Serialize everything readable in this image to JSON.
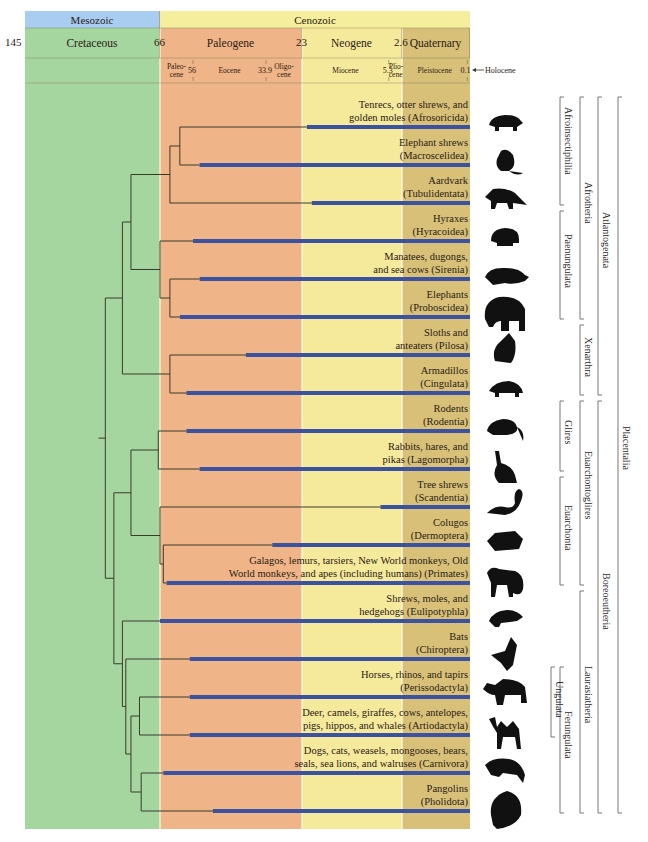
{
  "timescale": {
    "eras": [
      {
        "name": "Mesozoic",
        "color": "#a8cdf0"
      },
      {
        "name": "Cenozoic",
        "color": "#f5ee9c"
      }
    ],
    "periods": [
      {
        "name": "Cretaceous",
        "start_ma": 145,
        "end_ma": 66,
        "color": "#a6d6a0"
      },
      {
        "name": "Paleogene",
        "start_ma": 66,
        "end_ma": 23,
        "color": "#efb487"
      },
      {
        "name": "Neogene",
        "start_ma": 23,
        "end_ma": 2.6,
        "color": "#f5ea9c"
      },
      {
        "name": "Quaternary",
        "start_ma": 2.6,
        "end_ma": 0,
        "color": "#d8c078"
      }
    ],
    "period_boundaries": [
      "145",
      "66",
      "23",
      "2.6"
    ],
    "epochs": [
      {
        "name": "Paleo-\ncene",
        "start_ma": 66,
        "end_ma": 56
      },
      {
        "name": "Eocene",
        "start_ma": 56,
        "end_ma": 33.9
      },
      {
        "name": "Oligo-\ncene",
        "start_ma": 33.9,
        "end_ma": 23
      },
      {
        "name": "Miocene",
        "start_ma": 23,
        "end_ma": 5.3
      },
      {
        "name": "Plio-\ncene",
        "start_ma": 5.3,
        "end_ma": 2.6
      },
      {
        "name": "Pleistocene",
        "start_ma": 2.6,
        "end_ma": 0.1
      }
    ],
    "epoch_boundaries": [
      "56",
      "33.9",
      "5.3",
      "0.1"
    ],
    "holocene_label": "Holocene",
    "unit": "Ma"
  },
  "chart_data": {
    "type": "phylogeny",
    "title": "",
    "x_axis": {
      "label": "Millions of years ago",
      "range": [
        145,
        0
      ]
    },
    "leaves": [
      {
        "id": "afrosoricida",
        "label": "Tenrecs, otter shrews, and\ngolden moles (Afrosoricida)",
        "crown_age_ma": 22
      },
      {
        "id": "macroscelidea",
        "label": "Elephant shrews\n(Macroscelidea)",
        "crown_age_ma": 54
      },
      {
        "id": "tubulidentata",
        "label": "Aardvark\n(Tubulidentata)",
        "crown_age_ma": 21
      },
      {
        "id": "hyracoidea",
        "label": "Hyraxes\n(Hyracoidea)",
        "crown_age_ma": 56
      },
      {
        "id": "sirenia",
        "label": "Manatees, dugongs,\nand sea cows (Sirenia)",
        "crown_age_ma": 54
      },
      {
        "id": "proboscidea",
        "label": "Elephants\n(Proboscidea)",
        "crown_age_ma": 60
      },
      {
        "id": "pilosa",
        "label": "Sloths and\nanteaters (Pilosa)",
        "crown_age_ma": 40
      },
      {
        "id": "cingulata",
        "label": "Armadillos\n(Cingulata)",
        "crown_age_ma": 58
      },
      {
        "id": "rodentia",
        "label": "Rodents\n(Rodentia)",
        "crown_age_ma": 58
      },
      {
        "id": "lagomorpha",
        "label": "Rabbits, hares, and\npikas (Lagomorpha)",
        "crown_age_ma": 54
      },
      {
        "id": "scandentia",
        "label": "Tree shrews\n(Scandentia)",
        "crown_age_ma": 7
      },
      {
        "id": "dermoptera",
        "label": "Colugos\n(Dermoptera)",
        "crown_age_ma": 32
      },
      {
        "id": "primates",
        "label": "Galagos, lemurs, tarsiers, New World monkeys, Old\nWorld monkeys, and apes (including humans) (Primates)",
        "crown_age_ma": 64
      },
      {
        "id": "eulipotyphla",
        "label": "Shrews, moles, and\nhedgehogs (Eulipotyphla)",
        "crown_age_ma": 66
      },
      {
        "id": "chiroptera",
        "label": "Bats\n(Chiroptera)",
        "crown_age_ma": 57
      },
      {
        "id": "perissodactyla",
        "label": "Horses, rhinos, and tapirs\n(Perissodactyla)",
        "crown_age_ma": 57
      },
      {
        "id": "artiodactyla",
        "label": "Deer, camels, giraffes, cows, antelopes,\npigs, hippos, and whales (Artiodactyla)",
        "crown_age_ma": 57
      },
      {
        "id": "carnivora",
        "label": "Dogs, cats, weasels, mongooses, bears,\nseals, sea lions, and walruses (Carnivora)",
        "crown_age_ma": 65
      },
      {
        "id": "pholidota",
        "label": "Pangolins\n(Pholidota)",
        "crown_age_ma": 50
      }
    ],
    "nodes": [
      {
        "id": "n_afroinsect_a",
        "age_ma": 60,
        "children": [
          "afrosoricida",
          "macroscelidea"
        ]
      },
      {
        "id": "n_afroinsectiphilia",
        "age_ma": 63,
        "children": [
          "n_afroinsect_a",
          "tubulidentata"
        ]
      },
      {
        "id": "n_paen_a",
        "age_ma": 63,
        "children": [
          "sirenia",
          "proboscidea"
        ]
      },
      {
        "id": "n_paenungulata",
        "age_ma": 66,
        "children": [
          "hyracoidea",
          "n_paen_a"
        ]
      },
      {
        "id": "n_afrotheria",
        "age_ma": 83,
        "children": [
          "n_afroinsectiphilia",
          "n_paenungulata"
        ]
      },
      {
        "id": "n_xenarthra",
        "age_ma": 63,
        "children": [
          "pilosa",
          "cingulata"
        ]
      },
      {
        "id": "n_atlantogenata",
        "age_ma": 88,
        "children": [
          "n_afrotheria",
          "n_xenarthra"
        ]
      },
      {
        "id": "n_glires",
        "age_ma": 67,
        "children": [
          "rodentia",
          "lagomorpha"
        ]
      },
      {
        "id": "n_primatomorpha",
        "age_ma": 65,
        "children": [
          "dermoptera",
          "primates"
        ]
      },
      {
        "id": "n_euarchonta",
        "age_ma": 66,
        "children": [
          "scandentia",
          "n_primatomorpha"
        ]
      },
      {
        "id": "n_euarchontoglires",
        "age_ma": 83,
        "children": [
          "n_glires",
          "n_euarchonta"
        ]
      },
      {
        "id": "n_ungulata",
        "age_ma": 78,
        "children": [
          "perissodactyla",
          "artiodactyla"
        ]
      },
      {
        "id": "n_ferae",
        "age_ma": 77,
        "children": [
          "carnivora",
          "pholidota"
        ]
      },
      {
        "id": "n_fereungulata",
        "age_ma": 83,
        "children": [
          "n_ungulata",
          "n_ferae"
        ]
      },
      {
        "id": "n_scrotifera",
        "age_ma": 86,
        "children": [
          "chiroptera",
          "n_fereungulata"
        ]
      },
      {
        "id": "n_laurasiatheria",
        "age_ma": 88,
        "children": [
          "eulipotyphla",
          "n_scrotifera"
        ]
      },
      {
        "id": "n_boreoeutheria",
        "age_ma": 93,
        "children": [
          "n_euarchontoglires",
          "n_laurasiatheria"
        ]
      },
      {
        "id": "n_placentalia",
        "age_ma": 98,
        "children": [
          "n_atlantogenata",
          "n_boreoeutheria"
        ]
      }
    ],
    "root_stem_ma": 102
  },
  "clades": [
    {
      "name": "Afroinsectiphilia",
      "from": 0,
      "to": 2,
      "level": 0
    },
    {
      "name": "Paenungulata",
      "from": 3,
      "to": 5,
      "level": 0
    },
    {
      "name": "Afrotheria",
      "from": 0,
      "to": 5,
      "level": 1
    },
    {
      "name": "Xenarthra",
      "from": 6,
      "to": 7,
      "level": 1
    },
    {
      "name": "Atlantogenata",
      "from": 0,
      "to": 7,
      "level": 2
    },
    {
      "name": "Glires",
      "from": 8,
      "to": 9,
      "level": 0
    },
    {
      "name": "Euarchonta",
      "from": 10,
      "to": 12,
      "level": 0
    },
    {
      "name": "Euarchontoglires",
      "from": 8,
      "to": 12,
      "level": 1
    },
    {
      "name": "Ungulata",
      "from": 15,
      "to": 16,
      "level": -1
    },
    {
      "name": "Ferungulata",
      "from": 15,
      "to": 18,
      "level": 0
    },
    {
      "name": "Laurasiatheria",
      "from": 13,
      "to": 18,
      "level": 1
    },
    {
      "name": "Boreoeutheria",
      "from": 8,
      "to": 18,
      "level": 2
    },
    {
      "name": "Placentalia",
      "from": 0,
      "to": 18,
      "level": 3
    }
  ],
  "silhouettes": [
    "tenrec-icon",
    "elephant-shrew-icon",
    "aardvark-icon",
    "hyrax-icon",
    "manatee-icon",
    "elephant-icon",
    "sloth-icon",
    "armadillo-icon",
    "rodent-icon",
    "rabbit-icon",
    "tree-shrew-icon",
    "colugo-icon",
    "primate-icon",
    "shrew-icon",
    "bat-icon",
    "rhino-icon",
    "camel-icon",
    "carnivore-icon",
    "pangolin-icon"
  ],
  "colors": {
    "branch": "#3b3a2a",
    "crown_bar": "#3a52a0",
    "mesozoic": "#a8cdf0",
    "cenozoic": "#f5ee9c"
  }
}
